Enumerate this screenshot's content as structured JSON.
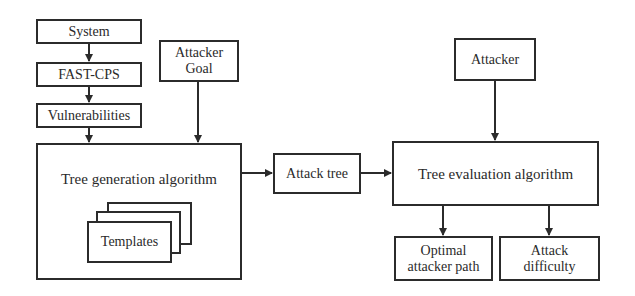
{
  "diagram": {
    "nodes": {
      "system": "System",
      "fast_cps": "FAST-CPS",
      "vulnerabilities": "Vulnerabilities",
      "attacker_goal": "Attacker Goal",
      "tree_generation": "Tree generation algorithm",
      "templates": "Templates",
      "attack_tree": "Attack tree",
      "attacker": "Attacker",
      "tree_evaluation": "Tree evaluation algorithm",
      "optimal_path": "Optimal attacker path",
      "attack_difficulty": "Attack difficulty"
    },
    "edges": [
      {
        "from": "System",
        "to": "FAST-CPS"
      },
      {
        "from": "FAST-CPS",
        "to": "Vulnerabilities"
      },
      {
        "from": "Vulnerabilities",
        "to": "Tree generation algorithm"
      },
      {
        "from": "Attacker Goal",
        "to": "Tree generation algorithm"
      },
      {
        "from": "Tree generation algorithm",
        "to": "Attack tree"
      },
      {
        "from": "Attack tree",
        "to": "Tree evaluation algorithm"
      },
      {
        "from": "Attacker",
        "to": "Tree evaluation algorithm"
      },
      {
        "from": "Tree evaluation algorithm",
        "to": "Optimal attacker path"
      },
      {
        "from": "Tree evaluation algorithm",
        "to": "Attack difficulty"
      }
    ],
    "colors": {
      "stroke": "#2b2b2b",
      "background": "#ffffff",
      "text": "#2a2a2a"
    }
  }
}
